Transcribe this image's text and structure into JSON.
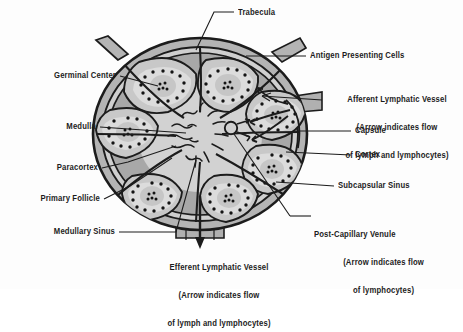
{
  "figure": {
    "background_color": "#fdfdfd",
    "ink_color": "#1c1c1c"
  },
  "palette": {
    "capsule_outline": "#262626",
    "capsule_fill": "#b4b4b4",
    "subcapsular_sinus": "#cfcfcf",
    "cortex": "#a8a8a8",
    "paracortex": "#c8c8c8",
    "follicle": "#dcdcdc",
    "germinal_center": "#cccccc",
    "medulla": "#d8d8d8",
    "lymphocyte_dot": "#141414",
    "vessel_fill": "#b0b0b0"
  },
  "labels": {
    "trabecula": {
      "lines": [
        "Trabecula"
      ],
      "align": "left",
      "x": 238,
      "y": 13
    },
    "antigen_presenting_cells": {
      "lines": [
        "Antigen Presenting Cells"
      ],
      "align": "left",
      "x": 310,
      "y": 56
    },
    "afferent_lymphatic_vessel": {
      "lines": [
        "Afferent Lymphatic Vessel",
        "(Arrow indicates flow",
        "of lymph and lymphocytes)"
      ],
      "align": "center",
      "x": 337,
      "y": 84
    },
    "capsule": {
      "lines": [
        "Capsule"
      ],
      "align": "left",
      "x": 355,
      "y": 131
    },
    "cortex": {
      "lines": [
        "Cortex"
      ],
      "align": "left",
      "x": 355,
      "y": 155
    },
    "subcapsular_sinus": {
      "lines": [
        "Subcapsular Sinus"
      ],
      "align": "left",
      "x": 338,
      "y": 186
    },
    "post_capillary_venule": {
      "lines": [
        "Post-Capillary Venule",
        "(Arrow indicates flow",
        "of lymphocytes)"
      ],
      "align": "center",
      "x": 372,
      "y": 216
    },
    "germinal_center": {
      "lines": [
        "Germinal Center"
      ],
      "align": "right",
      "x": 116,
      "y": 76
    },
    "medulla": {
      "lines": [
        "Medulla"
      ],
      "align": "right",
      "x": 96,
      "y": 127
    },
    "paracortex": {
      "lines": [
        "Paracortex"
      ],
      "align": "right",
      "x": 98,
      "y": 168
    },
    "primary_follicle": {
      "lines": [
        "Primary Follicle"
      ],
      "align": "right",
      "x": 100,
      "y": 199
    },
    "medullary_sinus": {
      "lines": [
        "Medullary Sinus"
      ],
      "align": "right",
      "x": 115,
      "y": 232
    },
    "efferent_lymphatic_vessel": {
      "lines": [
        "Efferent Lymphatic Vessel",
        "(Arrow indicates flow",
        "of lymph and lymphocytes)"
      ],
      "align": "center",
      "x": 219,
      "y": 249
    }
  }
}
